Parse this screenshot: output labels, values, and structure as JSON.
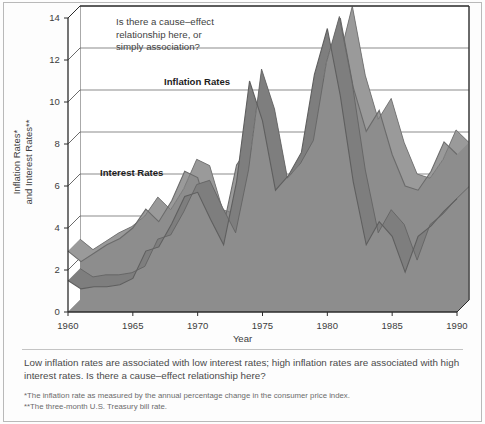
{
  "figure": {
    "annotation": "Is there a cause–effect\nrelationship here, or\nsimply association?",
    "series_labels": {
      "inflation": "Inflation Rates",
      "interest": "Interest Rates"
    }
  },
  "caption": {
    "main": "Low inflation rates are associated with low interest rates; high inflation rates are associated with high interest rates. Is there a cause–effect relationship here?",
    "footnote1": "*The inflation rate as measured by the annual percentage change in the consumer price index.",
    "footnote2": "**The three-month U.S. Treasury bill rate."
  },
  "colors": {
    "area_fill": "#8d8d8d",
    "ribbon_side": "#6f6f6f",
    "ribbon_top": "#a3a3a3",
    "axis": "#2b2b2b",
    "grid": "#5a5a5a",
    "page_background": "#fdfdfd",
    "text": "#3c3c3c"
  },
  "chart_data": {
    "type": "area",
    "title": "",
    "xlabel": "Year",
    "ylabel": "Inflation Rates*\nand Interest Rates**",
    "xlim": [
      1960,
      1990
    ],
    "ylim": [
      0,
      14
    ],
    "yticks": [
      0,
      2,
      4,
      6,
      8,
      10,
      12,
      14
    ],
    "xticks": [
      1960,
      1965,
      1970,
      1975,
      1980,
      1985,
      1990
    ],
    "grid": true,
    "legend_position": "inline-annotations",
    "x": [
      1960,
      1961,
      1962,
      1963,
      1964,
      1965,
      1966,
      1967,
      1968,
      1969,
      1970,
      1971,
      1972,
      1973,
      1974,
      1975,
      1976,
      1977,
      1978,
      1979,
      1980,
      1981,
      1982,
      1983,
      1984,
      1985,
      1986,
      1987,
      1988,
      1989,
      1990
    ],
    "series": [
      {
        "name": "Interest Rates",
        "values": [
          2.9,
          2.4,
          2.8,
          3.2,
          3.5,
          4.0,
          4.9,
          4.3,
          5.3,
          6.7,
          6.4,
          4.3,
          4.1,
          7.0,
          7.9,
          5.8,
          5.0,
          5.3,
          7.2,
          10.0,
          11.5,
          14.0,
          10.7,
          8.6,
          9.6,
          7.5,
          6.0,
          5.8,
          6.7,
          8.1,
          7.5
        ]
      },
      {
        "name": "Inflation Rates",
        "values": [
          1.5,
          1.1,
          1.2,
          1.2,
          1.3,
          1.6,
          2.9,
          3.1,
          4.2,
          5.5,
          5.7,
          4.4,
          3.2,
          6.2,
          11.0,
          9.1,
          5.8,
          6.5,
          7.6,
          11.3,
          13.5,
          10.3,
          6.2,
          3.2,
          4.3,
          3.6,
          1.9,
          3.6,
          4.1,
          4.8,
          5.4
        ]
      }
    ]
  }
}
